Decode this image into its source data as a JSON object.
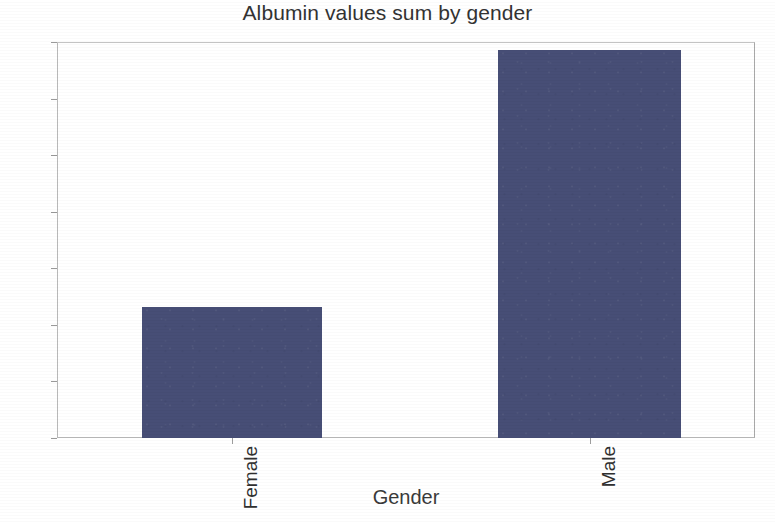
{
  "chart_data": {
    "type": "bar",
    "title": "Albumin values sum by gender",
    "xlabel": "Gender",
    "ylabel": "",
    "categories": [
      "Female",
      "Male"
    ],
    "values": [
      462,
      1372
    ],
    "ylim": [
      0,
      1400
    ],
    "yticks": [
      0,
      200,
      400,
      600,
      800,
      1000,
      1200,
      1400
    ],
    "ytick_labels": [
      "0",
      "200",
      "400",
      "600",
      "800",
      "1000",
      "1200",
      "1400"
    ],
    "grid": false,
    "legend": null,
    "bar_color": "#474E76",
    "frame_color": "#b9b9b9",
    "background": "#ffffff",
    "category_label_rotation": -90
  },
  "axes": {
    "y_ticks": [
      {
        "label": "1400",
        "value": 1400
      },
      {
        "label": "1200",
        "value": 1200
      },
      {
        "label": "1000",
        "value": 1000
      },
      {
        "label": "800",
        "value": 800
      },
      {
        "label": "600",
        "value": 600
      },
      {
        "label": "400",
        "value": 400
      },
      {
        "label": "200",
        "value": 200
      },
      {
        "label": "0",
        "value": 0
      }
    ]
  }
}
